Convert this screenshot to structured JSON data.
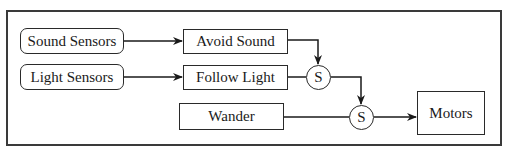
{
  "diagram": {
    "type": "subsumption-architecture",
    "nodes": {
      "sound_sensors": {
        "label": "Sound Sensors",
        "shape": "rounded-rect"
      },
      "light_sensors": {
        "label": "Light Sensors",
        "shape": "rounded-rect"
      },
      "avoid_sound": {
        "label": "Avoid Sound",
        "shape": "rect"
      },
      "follow_light": {
        "label": "Follow Light",
        "shape": "rect"
      },
      "wander": {
        "label": "Wander",
        "shape": "rect"
      },
      "suppress_1": {
        "label": "S",
        "shape": "circle"
      },
      "suppress_2": {
        "label": "S",
        "shape": "circle"
      },
      "motors": {
        "label": "Motors",
        "shape": "rect"
      }
    },
    "edges": [
      {
        "from": "Sound Sensors",
        "to": "Avoid Sound",
        "arrow": true
      },
      {
        "from": "Light Sensors",
        "to": "Follow Light",
        "arrow": true
      },
      {
        "from": "Avoid Sound",
        "to": "S (1)",
        "arrow": true
      },
      {
        "from": "Follow Light",
        "to": "S (1)",
        "arrow": false
      },
      {
        "from": "S (1)",
        "to": "S (2)",
        "arrow": true
      },
      {
        "from": "Wander",
        "to": "S (2)",
        "arrow": false
      },
      {
        "from": "S (2)",
        "to": "Motors",
        "arrow": true
      }
    ]
  }
}
